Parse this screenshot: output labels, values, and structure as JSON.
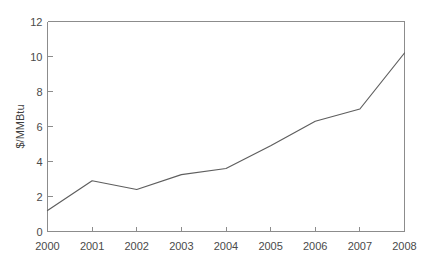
{
  "caption": {
    "text": "natural gas prices, which have been rising steadily"
  },
  "figure": {
    "background_color": "#ffffff",
    "line_color": "#5e5e5e",
    "axis_color": "#8c8c8c",
    "text_color": "#4a4a4a"
  },
  "chart_data": {
    "type": "line",
    "title": "",
    "subtitle": "",
    "xlabel": "",
    "ylabel": "$/MMBtu",
    "x": [
      2000,
      2001,
      2002,
      2003,
      2004,
      2005,
      2006,
      2007,
      2008
    ],
    "xtick_labels": [
      "2000",
      "2001",
      "2002",
      "2003",
      "2004",
      "2005",
      "2006",
      "2007",
      "2008"
    ],
    "ytick_labels": [
      "0",
      "2",
      "4",
      "6",
      "8",
      "10",
      "12"
    ],
    "ytick_values": [
      0,
      2,
      4,
      6,
      8,
      10,
      12
    ],
    "xlim": [
      2000,
      2008
    ],
    "ylim": [
      0,
      12
    ],
    "grid": false,
    "legend": false,
    "legend_position": "none",
    "markers": false,
    "series": [
      {
        "name": "$/MMBtu",
        "values": [
          1.2,
          2.9,
          2.4,
          3.25,
          3.6,
          4.9,
          6.3,
          7.0,
          10.2
        ]
      }
    ]
  }
}
